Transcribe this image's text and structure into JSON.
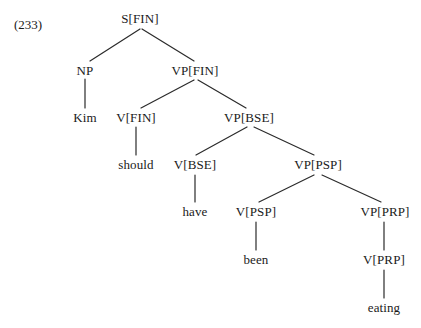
{
  "example": {
    "number_label": "(233)",
    "x": 14,
    "y": 24
  },
  "colors": {
    "background": "#ffffff",
    "text": "#1a1a1a",
    "edge": "#2b2b2b"
  },
  "tree": {
    "sentence": "Kim should have been eating",
    "nodes": [
      {
        "id": "s-fin",
        "label": "S[FIN]",
        "x": 140,
        "y": 18,
        "type": "nonterminal"
      },
      {
        "id": "np",
        "label": "NP",
        "x": 85,
        "y": 70,
        "type": "nonterminal"
      },
      {
        "id": "vp-fin",
        "label": "VP[FIN]",
        "x": 195,
        "y": 70,
        "type": "nonterminal"
      },
      {
        "id": "kim",
        "label": "Kim",
        "x": 85,
        "y": 117,
        "type": "terminal"
      },
      {
        "id": "v-fin",
        "label": "V[FIN]",
        "x": 136,
        "y": 117,
        "type": "nonterminal"
      },
      {
        "id": "vp-bse",
        "label": "VP[BSE]",
        "x": 249,
        "y": 117,
        "type": "nonterminal"
      },
      {
        "id": "should",
        "label": "should",
        "x": 136,
        "y": 164,
        "type": "terminal"
      },
      {
        "id": "v-bse",
        "label": "V[BSE]",
        "x": 195,
        "y": 164,
        "type": "nonterminal"
      },
      {
        "id": "vp-psp",
        "label": "VP[PSP]",
        "x": 318,
        "y": 164,
        "type": "nonterminal"
      },
      {
        "id": "have",
        "label": "have",
        "x": 195,
        "y": 211,
        "type": "terminal"
      },
      {
        "id": "v-psp",
        "label": "V[PSP]",
        "x": 256,
        "y": 211,
        "type": "nonterminal"
      },
      {
        "id": "vp-prp",
        "label": "VP[PRP]",
        "x": 385,
        "y": 211,
        "type": "nonterminal"
      },
      {
        "id": "been",
        "label": "been",
        "x": 256,
        "y": 259,
        "type": "terminal"
      },
      {
        "id": "v-prp",
        "label": "V[PRP]",
        "x": 384,
        "y": 259,
        "type": "nonterminal"
      },
      {
        "id": "eating",
        "label": "eating",
        "x": 384,
        "y": 307,
        "type": "terminal"
      }
    ],
    "edges": [
      {
        "from": "s-fin",
        "to": "np",
        "x1": 140,
        "y1": 29,
        "x2": 90,
        "y2": 61
      },
      {
        "from": "s-fin",
        "to": "vp-fin",
        "x1": 142,
        "y1": 29,
        "x2": 194,
        "y2": 61
      },
      {
        "from": "np",
        "to": "kim",
        "x1": 85,
        "y1": 79,
        "x2": 85,
        "y2": 108
      },
      {
        "from": "vp-fin",
        "to": "v-fin",
        "x1": 194,
        "y1": 80,
        "x2": 141,
        "y2": 108
      },
      {
        "from": "vp-fin",
        "to": "vp-bse",
        "x1": 198,
        "y1": 80,
        "x2": 246,
        "y2": 108
      },
      {
        "from": "v-fin",
        "to": "should",
        "x1": 136,
        "y1": 127,
        "x2": 136,
        "y2": 155
      },
      {
        "from": "vp-bse",
        "to": "v-bse",
        "x1": 247,
        "y1": 127,
        "x2": 196,
        "y2": 155
      },
      {
        "from": "vp-bse",
        "to": "vp-psp",
        "x1": 254,
        "y1": 127,
        "x2": 314,
        "y2": 155
      },
      {
        "from": "v-bse",
        "to": "have",
        "x1": 195,
        "y1": 175,
        "x2": 195,
        "y2": 202
      },
      {
        "from": "vp-psp",
        "to": "v-psp",
        "x1": 314,
        "y1": 175,
        "x2": 259,
        "y2": 202
      },
      {
        "from": "vp-psp",
        "to": "vp-prp",
        "x1": 322,
        "y1": 175,
        "x2": 381,
        "y2": 202
      },
      {
        "from": "v-psp",
        "to": "been",
        "x1": 256,
        "y1": 222,
        "x2": 256,
        "y2": 250
      },
      {
        "from": "vp-prp",
        "to": "v-prp",
        "x1": 384,
        "y1": 222,
        "x2": 384,
        "y2": 250
      },
      {
        "from": "v-prp",
        "to": "eating",
        "x1": 384,
        "y1": 270,
        "x2": 384,
        "y2": 298
      }
    ]
  }
}
